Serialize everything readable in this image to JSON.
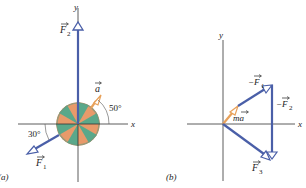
{
  "panel_a": {
    "label": "(a)",
    "axis_x": "x",
    "axis_y": "y",
    "vectors": {
      "F1": {
        "label": "F",
        "sub": "1",
        "angle_label": "30°"
      },
      "F2": {
        "label": "F",
        "sub": "2"
      },
      "a": {
        "label": "a",
        "angle_label": "50°"
      }
    }
  },
  "panel_b": {
    "label": "(b)",
    "axis_x": "x",
    "axis_y": "y",
    "vectors": {
      "ma": {
        "label": "ma"
      },
      "negF1": {
        "label": "−F",
        "sub": "1"
      },
      "negF2": {
        "label": "−F",
        "sub": "2"
      },
      "F3": {
        "label": "F",
        "sub": "3"
      }
    }
  },
  "colors": {
    "force": "#4a5fa8",
    "accel": "#e8a15a",
    "axis": "#333333",
    "disk_green": "#5aa88a",
    "disk_orange": "#e89a6a"
  }
}
